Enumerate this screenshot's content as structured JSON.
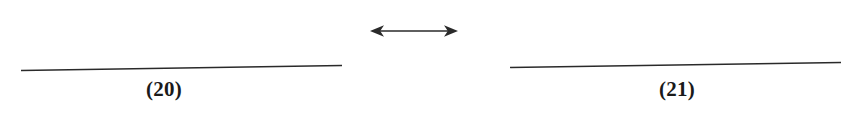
{
  "figure": {
    "background_color": "#ffffff",
    "ink_color": "#2a2a2a",
    "caption_color": "#1a1a1a",
    "width": 844,
    "height": 116
  },
  "panels": [
    {
      "caption": "(20)",
      "rule": {
        "x1": 21,
        "y1": 70,
        "x2": 342,
        "y2": 65
      }
    },
    {
      "caption": "(21)",
      "rule": {
        "x1": 510,
        "y1": 67,
        "x2": 841,
        "y2": 62
      }
    }
  ],
  "annotation": {
    "arrow_symbol": "double-headed-horizontal-arrow",
    "arrow_glyph": "↔",
    "x1": 370,
    "x2": 458,
    "y": 31
  }
}
